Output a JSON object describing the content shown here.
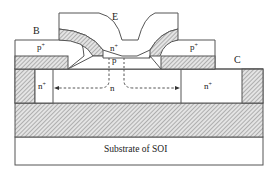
{
  "diagram": {
    "terminals": {
      "emitter": "E",
      "base": "B",
      "collector": "C"
    },
    "regions": {
      "emitter_doping": "n",
      "emitter_sup": "+",
      "base_doping": "p",
      "left_base_poly": "p",
      "left_base_poly_sup": "+",
      "right_base_poly": "p",
      "right_base_poly_sup": "+",
      "collector_drift": "n",
      "left_collector_contact": "n",
      "left_collector_contact_sup": "+",
      "right_collector_contact": "n",
      "right_collector_contact_sup": "+",
      "substrate": "Substrate of SOI"
    },
    "colors": {
      "line": "#555555",
      "hatch": "#8a8a8a",
      "fill": "#ffffff"
    }
  }
}
